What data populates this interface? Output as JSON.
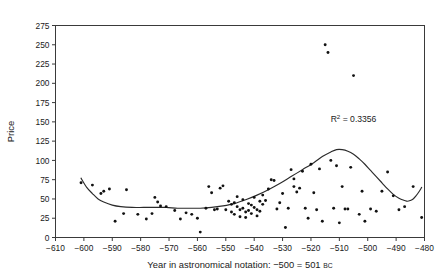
{
  "chart_data": {
    "type": "scatter",
    "title": "",
    "xlabel": "Year in astronomical notation: −500 = 501 BC",
    "xlabel_main": "Year in astronomical notation: −500 = 501 ",
    "xlabel_smallcaps": "BC",
    "ylabel": "Price",
    "xlim": [
      -610,
      -480
    ],
    "ylim": [
      0,
      275
    ],
    "xticks": [
      -610,
      -600,
      -590,
      -580,
      -570,
      -560,
      -550,
      -540,
      -530,
      -520,
      -510,
      -500,
      -490,
      -480
    ],
    "xticklabels": [
      "−610",
      "−600",
      "−590",
      "−580",
      "−570",
      "−560",
      "−550",
      "−540",
      "−530",
      "−520",
      "−510",
      "−500",
      "−490",
      "−480"
    ],
    "yticks": [
      0,
      25,
      50,
      75,
      100,
      125,
      150,
      175,
      200,
      225,
      250,
      275
    ],
    "yticklabels": [
      "0",
      "25",
      "50",
      "75",
      "100",
      "125",
      "150",
      "175",
      "200",
      "225",
      "250",
      "275"
    ],
    "grid": false,
    "legend": null,
    "annotations": [
      {
        "name": "r-squared",
        "text": "R² = 0.3356",
        "symbol": "R",
        "superscript": "2",
        "equals": " = ",
        "value": "0.3356",
        "x": -505,
        "y": 150
      }
    ],
    "series": [
      {
        "name": "Price observations",
        "type": "scatter",
        "marker": "dot",
        "color": "#111111",
        "points": [
          [
            -601,
            71
          ],
          [
            -597,
            68
          ],
          [
            -594,
            57
          ],
          [
            -593,
            60
          ],
          [
            -591,
            63
          ],
          [
            -589,
            21
          ],
          [
            -586,
            31
          ],
          [
            -585,
            62
          ],
          [
            -581,
            30
          ],
          [
            -578,
            24
          ],
          [
            -576,
            31
          ],
          [
            -575,
            52
          ],
          [
            -574,
            46
          ],
          [
            -573,
            41
          ],
          [
            -571,
            40
          ],
          [
            -568,
            35
          ],
          [
            -566,
            24
          ],
          [
            -564,
            32
          ],
          [
            -562,
            30
          ],
          [
            -560,
            25
          ],
          [
            -559,
            7
          ],
          [
            -557,
            38
          ],
          [
            -556,
            66
          ],
          [
            -555,
            58
          ],
          [
            -554,
            36
          ],
          [
            -553,
            37
          ],
          [
            -552,
            64
          ],
          [
            -551,
            67
          ],
          [
            -550,
            36
          ],
          [
            -549,
            47
          ],
          [
            -548,
            43
          ],
          [
            -548,
            33
          ],
          [
            -547,
            45
          ],
          [
            -547,
            30
          ],
          [
            -546,
            53
          ],
          [
            -546,
            40
          ],
          [
            -545,
            36
          ],
          [
            -545,
            27
          ],
          [
            -544,
            49
          ],
          [
            -544,
            38
          ],
          [
            -543,
            33
          ],
          [
            -543,
            26
          ],
          [
            -542,
            44
          ],
          [
            -542,
            35
          ],
          [
            -541,
            42
          ],
          [
            -541,
            31
          ],
          [
            -540,
            52
          ],
          [
            -540,
            39
          ],
          [
            -539,
            36
          ],
          [
            -539,
            28
          ],
          [
            -538,
            47
          ],
          [
            -538,
            34
          ],
          [
            -537,
            55
          ],
          [
            -537,
            43
          ],
          [
            -536,
            48
          ],
          [
            -535,
            63
          ],
          [
            -534,
            75
          ],
          [
            -533,
            74
          ],
          [
            -532,
            37
          ],
          [
            -531,
            45
          ],
          [
            -530,
            57
          ],
          [
            -529,
            13
          ],
          [
            -528,
            38
          ],
          [
            -527,
            88
          ],
          [
            -526,
            66
          ],
          [
            -526,
            76
          ],
          [
            -525,
            59
          ],
          [
            -524,
            64
          ],
          [
            -523,
            86
          ],
          [
            -522,
            38
          ],
          [
            -521,
            25
          ],
          [
            -520,
            95
          ],
          [
            -519,
            58
          ],
          [
            -518,
            36
          ],
          [
            -517,
            89
          ],
          [
            -516,
            21
          ],
          [
            -515,
            250
          ],
          [
            -514,
            240
          ],
          [
            -513,
            100
          ],
          [
            -512,
            38
          ],
          [
            -511,
            93
          ],
          [
            -510,
            19
          ],
          [
            -509,
            66
          ],
          [
            -508,
            37
          ],
          [
            -507,
            37
          ],
          [
            -506,
            91
          ],
          [
            -505,
            210
          ],
          [
            -503,
            30
          ],
          [
            -502,
            60
          ],
          [
            -501,
            21
          ],
          [
            -499,
            37
          ],
          [
            -497,
            34
          ],
          [
            -495,
            60
          ],
          [
            -493,
            85
          ],
          [
            -491,
            54
          ],
          [
            -489,
            36
          ],
          [
            -487,
            40
          ],
          [
            -484,
            66
          ],
          [
            -481,
            26
          ]
        ]
      },
      {
        "name": "Polynomial trend",
        "type": "line",
        "color": "#2b2b2b",
        "points": [
          [
            -601,
            77
          ],
          [
            -599,
            65
          ],
          [
            -597,
            57
          ],
          [
            -595,
            50
          ],
          [
            -593,
            46
          ],
          [
            -590,
            42
          ],
          [
            -587,
            40
          ],
          [
            -583,
            39
          ],
          [
            -579,
            39
          ],
          [
            -575,
            39
          ],
          [
            -571,
            39
          ],
          [
            -567,
            38
          ],
          [
            -563,
            38
          ],
          [
            -559,
            38
          ],
          [
            -555,
            39
          ],
          [
            -551,
            41
          ],
          [
            -547,
            44
          ],
          [
            -543,
            49
          ],
          [
            -539,
            55
          ],
          [
            -535,
            62
          ],
          [
            -531,
            70
          ],
          [
            -527,
            79
          ],
          [
            -523,
            88
          ],
          [
            -519,
            97
          ],
          [
            -516,
            105
          ],
          [
            -513,
            111
          ],
          [
            -511,
            114
          ],
          [
            -509,
            114
          ],
          [
            -507,
            112
          ],
          [
            -505,
            108
          ],
          [
            -503,
            102
          ],
          [
            -501,
            95
          ],
          [
            -499,
            87
          ],
          [
            -497,
            79
          ],
          [
            -495,
            71
          ],
          [
            -493,
            63
          ],
          [
            -491,
            56
          ],
          [
            -489,
            51
          ],
          [
            -487,
            48
          ],
          [
            -486,
            47
          ],
          [
            -485,
            48
          ],
          [
            -484,
            50
          ],
          [
            -483,
            54
          ],
          [
            -482,
            59
          ],
          [
            -481,
            65
          ]
        ]
      }
    ]
  }
}
